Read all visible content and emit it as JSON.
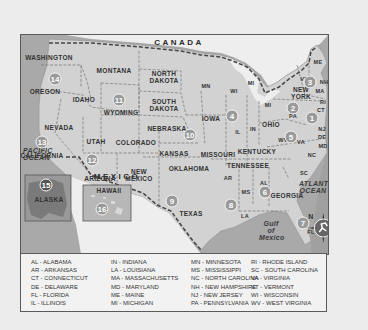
{
  "map": {
    "country_labels": {
      "canada": "CANADA",
      "mexico": "MEXICO"
    },
    "ocean_labels": {
      "pacific": "PACIFIC OCEAN",
      "atlantic": "ATLANTIC OCEAN",
      "gulf": "Gulf of Mexico"
    },
    "states": [
      {
        "id": "wa",
        "label": "WASHINGTON",
        "x": 28,
        "y": 22
      },
      {
        "id": "or",
        "label": "OREGON",
        "x": 24,
        "y": 56
      },
      {
        "id": "id",
        "label": "IDAHO",
        "x": 63,
        "y": 64
      },
      {
        "id": "mt",
        "label": "MONTANA",
        "x": 93,
        "y": 35
      },
      {
        "id": "wy",
        "label": "WYOMING",
        "x": 100,
        "y": 77
      },
      {
        "id": "nd",
        "label": "NORTH\nDAKOTA",
        "x": 143,
        "y": 42
      },
      {
        "id": "sd",
        "label": "SOUTH\nDAKOTA",
        "x": 143,
        "y": 70
      },
      {
        "id": "ne",
        "label": "NEBRASKA",
        "x": 146,
        "y": 93
      },
      {
        "id": "nv",
        "label": "NEVADA",
        "x": 38,
        "y": 92
      },
      {
        "id": "ut",
        "label": "UTAH",
        "x": 75,
        "y": 106
      },
      {
        "id": "co",
        "label": "COLORADO",
        "x": 115,
        "y": 107
      },
      {
        "id": "ks",
        "label": "KANSAS",
        "x": 153,
        "y": 118
      },
      {
        "id": "ca",
        "label": "CALIFORNIA",
        "x": 21,
        "y": 120
      },
      {
        "id": "az",
        "label": "ARIZONA",
        "x": 79,
        "y": 143
      },
      {
        "id": "nm",
        "label": "NEW\nMEXICO",
        "x": 118,
        "y": 140
      },
      {
        "id": "ok",
        "label": "OKLAHOMA",
        "x": 168,
        "y": 133
      },
      {
        "id": "tx",
        "label": "TEXAS",
        "x": 170,
        "y": 178
      },
      {
        "id": "mn",
        "label": "MN",
        "x": 185,
        "y": 51
      },
      {
        "id": "wi",
        "label": "WI",
        "x": 213,
        "y": 56
      },
      {
        "id": "mi_up",
        "label": "MI",
        "x": 230,
        "y": 48
      },
      {
        "id": "mi",
        "label": "MI",
        "x": 247,
        "y": 70
      },
      {
        "id": "ia",
        "label": "IOWA",
        "x": 190,
        "y": 83
      },
      {
        "id": "il",
        "label": "IL",
        "x": 217,
        "y": 97
      },
      {
        "id": "in",
        "label": "IN",
        "x": 232,
        "y": 94
      },
      {
        "id": "oh",
        "label": "OHIO",
        "x": 250,
        "y": 89
      },
      {
        "id": "mo",
        "label": "MISSOURI",
        "x": 197,
        "y": 119
      },
      {
        "id": "ky",
        "label": "KENTUCKY",
        "x": 236,
        "y": 116
      },
      {
        "id": "tn",
        "label": "TENNESSEE",
        "x": 227,
        "y": 130
      },
      {
        "id": "ar",
        "label": "AR",
        "x": 207,
        "y": 143
      },
      {
        "id": "ms",
        "label": "MS",
        "x": 225,
        "y": 157
      },
      {
        "id": "al",
        "label": "AL",
        "x": 243,
        "y": 148
      },
      {
        "id": "ga",
        "label": "GEORGIA",
        "x": 266,
        "y": 160
      },
      {
        "id": "la",
        "label": "LA",
        "x": 224,
        "y": 181
      },
      {
        "id": "fl",
        "label": "FL",
        "x": 290,
        "y": 197
      },
      {
        "id": "sc",
        "label": "SC",
        "x": 283,
        "y": 138
      },
      {
        "id": "nc",
        "label": "NC",
        "x": 291,
        "y": 120
      },
      {
        "id": "va",
        "label": "VA",
        "x": 280,
        "y": 107
      },
      {
        "id": "wv",
        "label": "WV",
        "x": 262,
        "y": 105
      },
      {
        "id": "pa",
        "label": "PA",
        "x": 272,
        "y": 81
      },
      {
        "id": "ny",
        "label": "NEW\nYORK",
        "x": 280,
        "y": 58
      },
      {
        "id": "vt",
        "label": "VT",
        "x": 283,
        "y": 44
      },
      {
        "id": "nh",
        "label": "NH",
        "x": 303,
        "y": 47
      },
      {
        "id": "me",
        "label": "ME",
        "x": 297,
        "y": 27
      },
      {
        "id": "ma",
        "label": "MA",
        "x": 299,
        "y": 56
      },
      {
        "id": "ri",
        "label": "RI",
        "x": 302,
        "y": 67
      },
      {
        "id": "ct",
        "label": "CT",
        "x": 300,
        "y": 75
      },
      {
        "id": "nj",
        "label": "NJ",
        "x": 301,
        "y": 94
      },
      {
        "id": "de",
        "label": "DE",
        "x": 301,
        "y": 102
      },
      {
        "id": "md",
        "label": "MD",
        "x": 302,
        "y": 111
      },
      {
        "id": "ak",
        "label": "ALASKA",
        "x": 28,
        "y": 164
      },
      {
        "id": "hi",
        "label": "HAWAII",
        "x": 88,
        "y": 155
      }
    ],
    "regions": [
      {
        "num": "1",
        "x": 291,
        "y": 83
      },
      {
        "num": "2",
        "x": 272,
        "y": 73
      },
      {
        "num": "3",
        "x": 289,
        "y": 47
      },
      {
        "num": "4",
        "x": 211,
        "y": 81
      },
      {
        "num": "5",
        "x": 270,
        "y": 102
      },
      {
        "num": "6",
        "x": 244,
        "y": 157
      },
      {
        "num": "7",
        "x": 282,
        "y": 188
      },
      {
        "num": "8",
        "x": 210,
        "y": 170
      },
      {
        "num": "9",
        "x": 151,
        "y": 166
      },
      {
        "num": "10",
        "x": 169,
        "y": 100
      },
      {
        "num": "11",
        "x": 98,
        "y": 65
      },
      {
        "num": "12",
        "x": 71,
        "y": 125
      },
      {
        "num": "13",
        "x": 21,
        "y": 107
      },
      {
        "num": "14",
        "x": 34,
        "y": 44
      },
      {
        "num": "15",
        "x": 25,
        "y": 150
      },
      {
        "num": "16",
        "x": 81,
        "y": 174
      }
    ],
    "compass": {
      "north_label": "N"
    }
  },
  "legend": {
    "columns": [
      [
        "AL - ALABAMA",
        "AR - ARKANSAS",
        "CT - CONNECTICUT",
        "DE - DELAWARE",
        "FL - FLORIDA",
        "IL - ILLINOIS"
      ],
      [
        "IN - INDIANA",
        "LA - LOUISIANA",
        "MA - MASSACHUSETTS",
        "MD - MARYLAND",
        "ME - MAINE",
        "MI - MICHIGAN"
      ],
      [
        "MN - MINNESOTA",
        "MS - MISSISSIPPI",
        "NC - NORTH CAROLINA",
        "NH - NEW HAMPSHIRE",
        "NJ - NEW JERSEY",
        "PA - PENNSYLVANIA"
      ],
      [
        "RI - RHODE ISLAND",
        "SC - SOUTH CAROLINA",
        "VA - VIRGINIA",
        "VT - VERMONT",
        "WI - WISCONSIN",
        "WV - WEST VIRGINIA"
      ]
    ]
  }
}
